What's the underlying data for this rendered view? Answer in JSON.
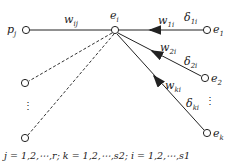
{
  "diagram": {
    "nodes": {
      "p_j": {
        "base": "p",
        "sub": "j"
      },
      "e_i": {
        "base": "e",
        "sub": "i"
      },
      "e_1": {
        "base": "e",
        "sub": "1"
      },
      "e_2": {
        "base": "e",
        "sub": "2"
      },
      "e_k": {
        "base": "e",
        "sub": "k"
      }
    },
    "edges": {
      "w_ij": {
        "base": "w",
        "sub": "ij"
      },
      "w_1i": {
        "base": "w",
        "sub": "1i"
      },
      "w_2i": {
        "base": "w",
        "sub": "2i"
      },
      "w_ki": {
        "base": "w",
        "sub": "ki"
      },
      "d_1i": {
        "base": "δ",
        "sub": "1i"
      },
      "d_2i": {
        "base": "δ",
        "sub": "2i"
      },
      "d_ki": {
        "base": "δ",
        "sub": "ki"
      }
    },
    "ellipsis": "⋮",
    "caption": "j = 1,2,⋯,r;   k = 1,2,⋯,s2;   i = 1,2,⋯,s1"
  },
  "colors": {
    "stroke": "#222222",
    "background": "#ffffff"
  }
}
